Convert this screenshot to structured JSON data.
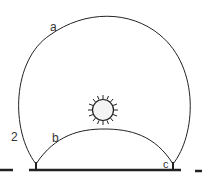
{
  "diagram": {
    "labels": {
      "outer_arc": "a",
      "inner_arc": "b",
      "right_foot": "c",
      "left_side": "2"
    },
    "colors": {
      "stroke": "#222222",
      "sun_fill": "#f4f4f4",
      "background": "#ffffff"
    }
  }
}
